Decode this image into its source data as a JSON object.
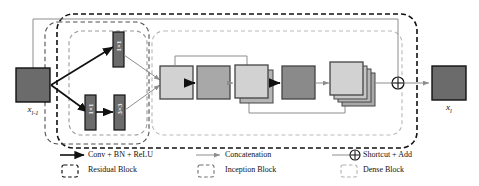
{
  "figure": {
    "type": "neural-network-block-diagram"
  },
  "io": {
    "input_label": "x",
    "input_sub": "l-1",
    "output_label": "x",
    "output_sub": "l"
  },
  "inception": {
    "branches": [
      {
        "id": "top",
        "ops": [
          "1×1"
        ]
      },
      {
        "id": "bottom",
        "ops": [
          "1×1",
          "3×3"
        ]
      }
    ],
    "op_labels": {
      "top_1": "1×1",
      "bottom_1": "1×1",
      "bottom_2": "3×3"
    }
  },
  "dense": {
    "layers": [
      {
        "index": 1,
        "fill": "#d2d2d2",
        "stack": 1
      },
      {
        "index": 2,
        "fill": "#a8a8a8",
        "stack": 1
      },
      {
        "index": 3,
        "fill": "#d2d2d2",
        "stack": 2
      },
      {
        "index": 4,
        "fill": "#8a8a8a",
        "stack": 1
      },
      {
        "index": 5,
        "fill": "#d2d2d2",
        "stack": 4
      }
    ],
    "skips": [
      "layer1-to-layer3",
      "layer3-to-layer5"
    ]
  },
  "shortcut": {
    "symbol": "⊕",
    "path": "input-to-add"
  },
  "legend": {
    "items": [
      {
        "glyph": "arrow-solid-black",
        "label": "Conv + BN + ReLU"
      },
      {
        "glyph": "dashed-box-black",
        "label": "Residual Block"
      },
      {
        "glyph": "arrow-thin-gray",
        "label": "Concatenation"
      },
      {
        "glyph": "dashed-box-gray",
        "label": "Inception Block"
      },
      {
        "glyph": "arrow-plus-circle",
        "label": "Shortcut + Add"
      },
      {
        "glyph": "dashed-box-light",
        "label": "Dense Block"
      }
    ]
  },
  "colors": {
    "block_dark": "#6b6b6b",
    "block_light": "#d2d2d2",
    "block_mid": "#a8a8a8",
    "block_darkmid": "#8a8a8a",
    "outline": "#111111",
    "gray_line": "#8d8d8d",
    "dash_outer": "#111111",
    "dash_mid": "#555555",
    "dash_inner": "#9a9a9a"
  }
}
